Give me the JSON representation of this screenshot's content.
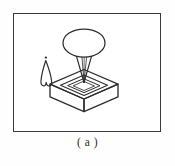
{
  "figure": {
    "caption": "( a )",
    "frame": {
      "x": 13,
      "y": 13,
      "width": 148,
      "height": 119,
      "border_color": "#3a3a3a",
      "background_color": "#ffffff"
    },
    "ink_color": "#2e2e2e",
    "page_background": "#fefefe",
    "elements": [
      {
        "name": "canopy-ellipse",
        "label": "ellipse canopy",
        "shape": "ellipse",
        "cx": 70,
        "cy": 29,
        "rx": 21,
        "ry": 14
      },
      {
        "name": "funnel-stem",
        "label": "funnel stem",
        "shape": "tapered-lines",
        "top_left_x": 63,
        "top_right_x": 77,
        "top_y": 43,
        "apex_x": 70,
        "apex_y": 68
      },
      {
        "name": "pedestal-box",
        "label": "square pedestal box in perspective",
        "shape": "isometric-box",
        "top_center_x": 70,
        "top_center_y": 70,
        "half_width": 34,
        "half_depth": 15,
        "height": 13
      },
      {
        "name": "inner-rim",
        "label": "recessed inner rim",
        "shape": "isometric-square-ring"
      },
      {
        "name": "flame-figure",
        "label": "small pointed flame figure",
        "shape": "pointed-arch",
        "x": 27,
        "y": 46,
        "width": 11,
        "height": 26
      },
      {
        "name": "flame-dot",
        "label": "dot above flame figure",
        "shape": "dot",
        "cx": 32,
        "cy": 44,
        "r": 1.1
      }
    ]
  }
}
